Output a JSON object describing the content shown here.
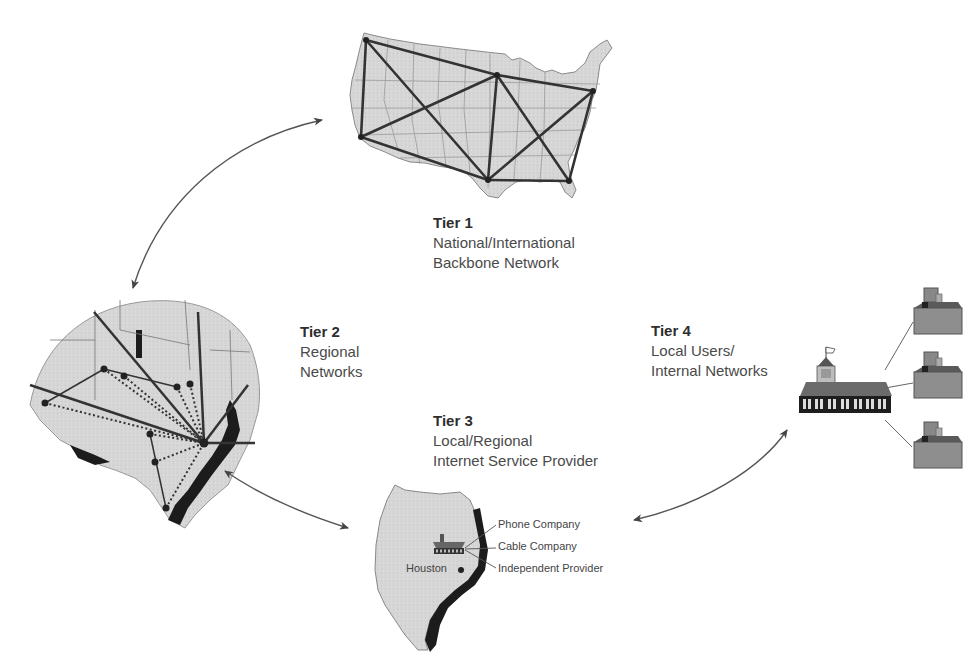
{
  "diagram": {
    "tiers": [
      {
        "id": "tier1",
        "label": "Tier 1",
        "line1": "National/International",
        "line2": "Backbone Network"
      },
      {
        "id": "tier2",
        "label": "Tier 2",
        "line1": "Regional",
        "line2": "Networks"
      },
      {
        "id": "tier3",
        "label": "Tier 3",
        "line1": "Local/Regional",
        "line2": "Internet Service Provider"
      },
      {
        "id": "tier4",
        "label": "Tier 4",
        "line1": "Local Users/",
        "line2": "Internal Networks"
      }
    ],
    "tier3_providers": [
      "Phone Company",
      "Cable Company",
      "Independent Provider"
    ],
    "tier3_city": "Houston",
    "connections": [
      {
        "from": "Tier 1",
        "to": "Tier 2",
        "type": "bidirectional"
      },
      {
        "from": "Tier 2",
        "to": "Tier 3",
        "type": "bidirectional"
      },
      {
        "from": "Tier 3",
        "to": "Tier 4",
        "type": "bidirectional"
      }
    ],
    "tier4_workstations": 3,
    "colors": {
      "map_fill": "#d4d4d4",
      "coast": "#1a1a1a",
      "lines": "#333333",
      "arrow": "#444444"
    }
  }
}
